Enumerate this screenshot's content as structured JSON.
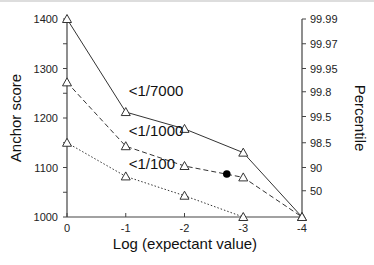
{
  "chart_data": {
    "type": "line",
    "title": "",
    "xlabel": "Log (expectant value)",
    "ylabel": "Anchor score",
    "y2label": "Percentile",
    "x": [
      0,
      -1,
      -2,
      -3,
      -4
    ],
    "xlim": [
      0,
      -4
    ],
    "ylim": [
      1000,
      1400
    ],
    "x_ticks": [
      "0",
      "-1",
      "-2",
      "-3",
      "-4"
    ],
    "y_ticks": [
      "1000",
      "1100",
      "1200",
      "1300",
      "1400"
    ],
    "y2_ticks": [
      {
        "label": "99.99",
        "at": 1400
      },
      {
        "label": "99.97",
        "at": 1350
      },
      {
        "label": "99.95",
        "at": 1300
      },
      {
        "label": "99.8",
        "at": 1253
      },
      {
        "label": "99.5",
        "at": 1203
      },
      {
        "label": "98.5",
        "at": 1150
      },
      {
        "label": "90",
        "at": 1100
      },
      {
        "label": "50",
        "at": 1053
      }
    ],
    "grid": false,
    "series": [
      {
        "name": "<1/7000",
        "style": "solid",
        "marker": "open-triangle",
        "x": [
          0,
          -1,
          -2,
          -3,
          -4
        ],
        "values": [
          1400,
          1212,
          1178,
          1130,
          1000
        ],
        "label_at": {
          "x": -1.05,
          "y": 1245
        }
      },
      {
        "name": "<1/1000",
        "style": "dashed",
        "marker": "open-triangle",
        "x": [
          0,
          -1,
          -2,
          -3,
          -4
        ],
        "values": [
          1272,
          1143,
          1103,
          1080,
          1000
        ],
        "label_at": {
          "x": -1.05,
          "y": 1163
        }
      },
      {
        "name": "<1/100",
        "style": "dotted",
        "marker": "open-triangle",
        "x": [
          0,
          -1,
          -2,
          -3
        ],
        "values": [
          1150,
          1082,
          1043,
          1000
        ],
        "label_at": {
          "x": -1.05,
          "y": 1097
        }
      }
    ],
    "annotations": [
      {
        "type": "filled-circle",
        "x": -2.72,
        "y": 1087
      }
    ]
  }
}
